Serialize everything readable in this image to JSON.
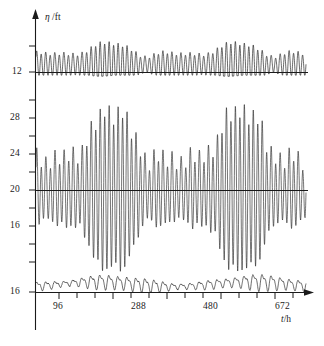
{
  "chart_data": {
    "type": "line",
    "title": "",
    "subtitle": "",
    "xlabel": "t/h",
    "ylabel": "η /ft",
    "xlabel_symbol": "t",
    "xlabel_unit": "/h",
    "ylabel_symbol": "η",
    "ylabel_unit": "/ft",
    "grid": false,
    "legend": null,
    "x": {
      "label": "t/h",
      "min": 0,
      "max": 744,
      "tick_labels": [
        "96",
        "288",
        "480",
        "672"
      ],
      "tick_values": [
        96,
        288,
        480,
        672
      ],
      "minor_tick_step": 48,
      "axis_arrow": true
    },
    "y": {
      "label": "η /ft",
      "tick_labels": [
        "12",
        "28",
        "24",
        "20",
        "16",
        "16"
      ],
      "tick_values": [
        12,
        28,
        24,
        20,
        16,
        16
      ],
      "axis_arrow": true,
      "note": "Three stacked tide records share one vertical axis; each record has its own datum line."
    },
    "series": [
      {
        "name": "upper-record-semidiurnal",
        "panel": "upper",
        "datum_value": 12,
        "datum_label": "12",
        "period_hours": 12.42,
        "mean_amplitude_ft": 1.6,
        "envelope_description": "spring-neap modulated, larger near t=600-700 h",
        "description": "semidiurnal tide, two nearly equal highs and lows each day"
      },
      {
        "name": "middle-record-mixed",
        "panel": "middle",
        "datum_value": 20,
        "datum_label": "20",
        "period_hours": 12.42,
        "mean_amplitude_ft": 5.5,
        "envelope_description": "large spring-neap modulation, maximum range near t=620-700 h",
        "description": "mixed tide with strong diurnal inequality, range roughly 16 ft at springs"
      },
      {
        "name": "lower-record-diurnal",
        "panel": "lower",
        "datum_value": 16,
        "datum_label": "16",
        "period_hours": 24.84,
        "mean_amplitude_ft": 0.5,
        "envelope_description": "small amplitude, slight swelling near t=540-680 h",
        "description": "low-amplitude record riding just above the 16 ft datum"
      }
    ],
    "colors": {
      "trace": "#1a1a1a",
      "axis": "#1a1a1a",
      "background": "#ffffff"
    }
  },
  "axis_labels": {
    "y_title_symbol": "η",
    "y_title_unit": " /ft",
    "x_title_symbol": "t",
    "x_title_unit": "/h",
    "y_ticks": {
      "t12": "12",
      "t28": "28",
      "t24": "24",
      "t20": "20",
      "t16": "16",
      "t16b": "16"
    },
    "x_ticks": {
      "t96": "96",
      "t288": "288",
      "t480": "480",
      "t672": "672"
    }
  }
}
